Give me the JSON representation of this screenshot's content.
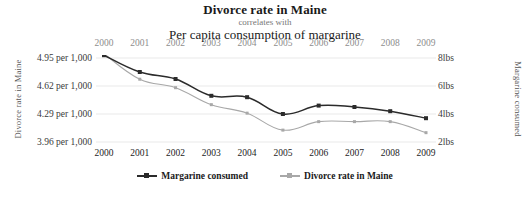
{
  "titles": {
    "top": "Divorce rate in Maine",
    "middle": "correlates with",
    "bottom": "Per capita consumption of margarine"
  },
  "axes": {
    "left_title": "Divorce rate in Maine",
    "right_title": "Margarine consumed",
    "left_ticks": [
      "4.95 per 1,000",
      "4.62 per 1,000",
      "4.29 per 1,000",
      "3.96 per 1,000"
    ],
    "right_ticks": [
      "8lbs",
      "6lbs",
      "4lbs",
      "2lbs"
    ]
  },
  "legend": {
    "items": [
      {
        "label": "Margarine consumed",
        "color": "#2b2b2b"
      },
      {
        "label": "Divorce rate in Maine",
        "color": "#a8a8a8"
      }
    ]
  },
  "colors": {
    "margarine": "#2b2b2b",
    "divorce": "#a8a8a8",
    "grid": "#e9e9e9",
    "background": "#ffffff"
  },
  "chart_data": {
    "type": "line",
    "title": "Divorce rate in Maine correlates with Per capita consumption of margarine",
    "subtitle": "correlates with",
    "xlabel": "",
    "grid": true,
    "legend_position": "bottom",
    "categories": [
      "2000",
      "2001",
      "2002",
      "2003",
      "2004",
      "2005",
      "2006",
      "2007",
      "2008",
      "2009"
    ],
    "x_tick_labels_top": [
      "2000",
      "2001",
      "2002",
      "2003",
      "2004",
      "2005",
      "2006",
      "2007",
      "2008",
      "2009"
    ],
    "x_tick_labels_bottom": [
      "2000",
      "2001",
      "2002",
      "2003",
      "2004",
      "2005",
      "2006",
      "2007",
      "2008",
      "2009"
    ],
    "series": [
      {
        "name": "Margarine consumed",
        "color": "#2b2b2b",
        "axis": "right",
        "unit": "lbs",
        "ylabel": "Margarine consumed",
        "ytick_labels": [
          "8lbs",
          "6lbs",
          "4lbs",
          "2lbs"
        ],
        "ytick_values": [
          8,
          6,
          4,
          2
        ],
        "ylim": [
          1.6,
          8.8
        ],
        "values": [
          8.2,
          7,
          6.5,
          5.3,
          5.2,
          4,
          4.6,
          4.5,
          4.2,
          3.7
        ]
      },
      {
        "name": "Divorce rate in Maine",
        "color": "#a8a8a8",
        "axis": "left",
        "unit": "per 1,000",
        "ylabel": "Divorce rate in Maine",
        "ytick_labels": [
          "4.95 per 1,000",
          "4.62 per 1,000",
          "4.29 per 1,000",
          "3.96 per 1,000"
        ],
        "ytick_values": [
          4.95,
          4.62,
          4.29,
          3.96
        ],
        "ylim": [
          3.8,
          5.08
        ],
        "values": [
          5.0,
          4.7,
          4.6,
          4.4,
          4.3,
          4.1,
          4.2,
          4.2,
          4.2,
          4.07
        ]
      }
    ]
  }
}
